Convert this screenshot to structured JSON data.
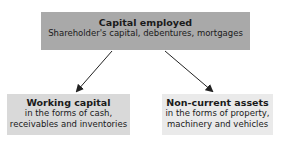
{
  "top": {
    "title": "Capital employed",
    "subtitle": "Shareholder's capital, debentures, mortgages"
  },
  "left": {
    "title": "Working capital",
    "lines": [
      "in the forms of cash,",
      "receivables and inventories"
    ]
  },
  "right": {
    "title": "Non-current assets",
    "lines": [
      "in the forms of property,",
      "machinery and vehicles"
    ]
  },
  "colors": {
    "top_box": "#a9a9a9",
    "left_box": "#d9d9d9",
    "right_box": "#eaeaea",
    "arrow": "#222222"
  }
}
